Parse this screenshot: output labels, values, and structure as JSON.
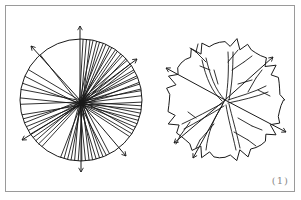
{
  "figure": {
    "label": "(1)",
    "panels": [
      {
        "name": "radial-line-circle",
        "description": "Circle filled with dense radial lines converging near center, with four outward arrows",
        "center": [
          81,
          100
        ],
        "radius": 61,
        "arrows": [
          "up",
          "upper-left",
          "upper-right",
          "lower-left",
          "lower-right",
          "down"
        ]
      },
      {
        "name": "tree-crown-plan",
        "description": "Plan-view tree symbol with scalloped crown outline, branching limbs, and four outward arrows",
        "center": [
          225,
          100
        ],
        "radius": 57,
        "arrows": [
          "upper-left",
          "upper-right",
          "lower-left",
          "lower-left-2",
          "lower-right"
        ]
      }
    ],
    "colors": {
      "line": "#1a1a1a",
      "frame": "#9a9a9a",
      "label": "#8a8a8a",
      "background": "#ffffff"
    }
  }
}
